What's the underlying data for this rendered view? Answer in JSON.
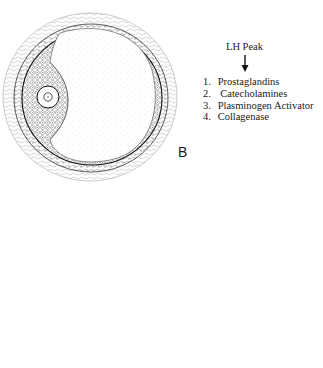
{
  "diagram": {
    "panel_label": "B",
    "header": "LH Peak",
    "arrow": "down-arrow",
    "factors": [
      {
        "num": "1.",
        "label": "Prostaglandins"
      },
      {
        "num": "2.",
        "label": "Catecholamines"
      },
      {
        "num": "3.",
        "label": "Plasminogen Activator"
      },
      {
        "num": "4.",
        "label": "Collagenase"
      }
    ],
    "colors": {
      "line": "#222222",
      "stipple": "#888888",
      "background": "#ffffff"
    }
  }
}
